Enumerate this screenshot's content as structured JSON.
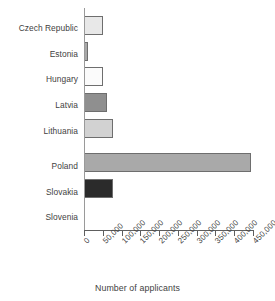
{
  "chart_data": {
    "type": "bar",
    "orientation": "horizontal",
    "title": "",
    "xlabel": "Number of applicants",
    "ylabel": "",
    "xlim": [
      0,
      450000
    ],
    "xtick_values": [
      0,
      50000,
      100000,
      150000,
      200000,
      250000,
      300000,
      350000,
      400000,
      450000
    ],
    "xtick_labels": [
      "0",
      "50,000",
      "100,000",
      "150,000",
      "200,000",
      "250,000",
      "300,000",
      "350,000",
      "400,000",
      "450,000"
    ],
    "grid": false,
    "legend": "none",
    "categories": [
      "Czech Republic",
      "Estonia",
      "Hungary",
      "Latvia",
      "Lithuania",
      "Poland",
      "Slovakia",
      "Slovenia"
    ],
    "values": [
      50000,
      10000,
      50000,
      60000,
      78000,
      445000,
      78000,
      0
    ],
    "bar_colors": [
      "#e8e8e8",
      "#a8a8a8",
      "#fbfbfb",
      "#8f8f8f",
      "#d2d2d2",
      "#a9a9a9",
      "#2b2b2b",
      "#ffffff"
    ],
    "bar_edge_color": "#6e6e6e",
    "axis_color": "#5e5e5e",
    "text_color": "#3f3f3f"
  }
}
